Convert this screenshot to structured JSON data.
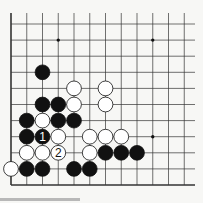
{
  "board": {
    "title": "Go problem diagram",
    "columns": 12,
    "rows": 11,
    "origin_x": 11,
    "origin_y": 24,
    "spacing_x": 15.75,
    "spacing_y": 16.1,
    "edges": [
      "left",
      "bottom"
    ],
    "line_color": "#333333",
    "background": "#f7f7f5",
    "star_points": [
      [
        3,
        1
      ],
      [
        9,
        1
      ],
      [
        9,
        7
      ]
    ],
    "stones": [
      {
        "color": "black",
        "col": 2,
        "row": 3
      },
      {
        "color": "white",
        "col": 4,
        "row": 4
      },
      {
        "color": "white",
        "col": 6,
        "row": 4
      },
      {
        "color": "black",
        "col": 2,
        "row": 5
      },
      {
        "color": "black",
        "col": 3,
        "row": 5
      },
      {
        "color": "white",
        "col": 4,
        "row": 5
      },
      {
        "color": "white",
        "col": 6,
        "row": 5
      },
      {
        "color": "black",
        "col": 1,
        "row": 6
      },
      {
        "color": "white",
        "col": 2,
        "row": 6
      },
      {
        "color": "black",
        "col": 3,
        "row": 6
      },
      {
        "color": "black",
        "col": 4,
        "row": 6
      },
      {
        "color": "black",
        "col": 1,
        "row": 7
      },
      {
        "color": "black",
        "col": 2,
        "row": 7,
        "label": "1"
      },
      {
        "color": "white",
        "col": 3,
        "row": 7
      },
      {
        "color": "white",
        "col": 5,
        "row": 7
      },
      {
        "color": "white",
        "col": 6,
        "row": 7
      },
      {
        "color": "white",
        "col": 7,
        "row": 7
      },
      {
        "color": "white",
        "col": 1,
        "row": 8
      },
      {
        "color": "white",
        "col": 2,
        "row": 8
      },
      {
        "color": "white",
        "col": 3,
        "row": 8,
        "label": "2"
      },
      {
        "color": "white",
        "col": 5,
        "row": 8
      },
      {
        "color": "black",
        "col": 6,
        "row": 8
      },
      {
        "color": "black",
        "col": 7,
        "row": 8
      },
      {
        "color": "black",
        "col": 8,
        "row": 8
      },
      {
        "color": "white",
        "col": 0,
        "row": 9
      },
      {
        "color": "black",
        "col": 1,
        "row": 9
      },
      {
        "color": "black",
        "col": 2,
        "row": 9
      },
      {
        "color": "black",
        "col": 4,
        "row": 9
      },
      {
        "color": "black",
        "col": 5,
        "row": 9
      }
    ],
    "move_labels": {
      "black_move": "1",
      "white_move": "2"
    }
  }
}
